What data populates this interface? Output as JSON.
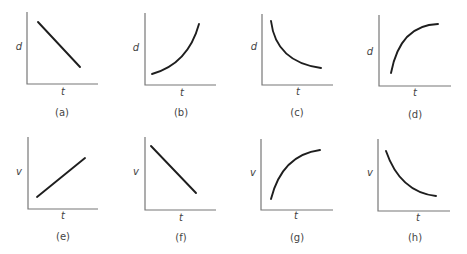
{
  "panels": [
    {
      "id": "a",
      "caption": "(a)",
      "ylabel": "d",
      "xlabel": "t",
      "shape": "straight line decreasing"
    },
    {
      "id": "b",
      "caption": "(b)",
      "ylabel": "d",
      "xlabel": "t",
      "shape": "increasing, concave up"
    },
    {
      "id": "c",
      "caption": "(c)",
      "ylabel": "d",
      "xlabel": "t",
      "shape": "decreasing, concave up"
    },
    {
      "id": "d",
      "caption": "(d)",
      "ylabel": "d",
      "xlabel": "t",
      "shape": "increasing, concave down"
    },
    {
      "id": "e",
      "caption": "(e)",
      "ylabel": "v",
      "xlabel": "t",
      "shape": "straight line increasing"
    },
    {
      "id": "f",
      "caption": "(f)",
      "ylabel": "v",
      "xlabel": "t",
      "shape": "straight line decreasing"
    },
    {
      "id": "g",
      "caption": "(g)",
      "ylabel": "v",
      "xlabel": "t",
      "shape": "increasing, concave down"
    },
    {
      "id": "h",
      "caption": "(h)",
      "ylabel": "v",
      "xlabel": "t",
      "shape": "decreasing, concave up"
    }
  ],
  "colors": {
    "axis": "#777777",
    "curve": "#1e1e1e",
    "text": "#444444"
  }
}
